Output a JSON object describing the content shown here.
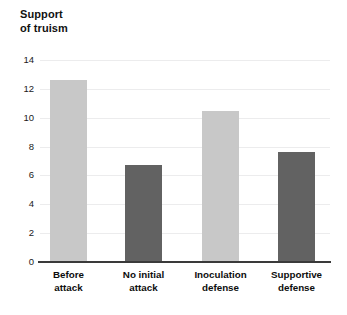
{
  "chart_data": {
    "type": "bar",
    "title": "Support\nof truism",
    "title_line1": "Support",
    "title_line2": "of truism",
    "xlabel": "",
    "ylabel": "Support of truism",
    "ylim": [
      0,
      14
    ],
    "yticks": [
      0,
      2,
      4,
      6,
      8,
      10,
      12,
      14
    ],
    "ytick_labels": [
      "0",
      "2",
      "4",
      "6",
      "8",
      "10",
      "12",
      "14"
    ],
    "grid": true,
    "legend": "none",
    "categories": [
      "Before attack",
      "No initial attack",
      "Inoculation defense",
      "Supportive defense"
    ],
    "category_lines": [
      [
        "Before",
        "attack"
      ],
      [
        "No initial",
        "attack"
      ],
      [
        "Inoculation",
        "defense"
      ],
      [
        "Supportive",
        "defense"
      ]
    ],
    "values": [
      12.6,
      6.7,
      10.5,
      7.6
    ],
    "bar_colors": [
      "#c8c8c8",
      "#626262",
      "#c8c8c8",
      "#626262"
    ],
    "series": [
      {
        "name": "Support of truism",
        "values": [
          12.6,
          6.7,
          10.5,
          7.6
        ]
      }
    ]
  },
  "style": {
    "background": "#ffffff",
    "gridline_color": "#ececed",
    "axis_color": "#3a3a3a",
    "text_color": "#111111",
    "light_bar": "#c8c8c8",
    "dark_bar": "#626262"
  }
}
